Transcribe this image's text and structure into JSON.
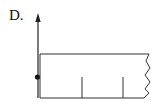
{
  "figure": {
    "option_label": "D.",
    "stroke_color": "#222222",
    "background": "#ffffff"
  },
  "diagram": {
    "elements": [
      {
        "type": "arrow",
        "direction": "up",
        "x": 38,
        "y_from": 98,
        "y_to": 15
      },
      {
        "type": "dot",
        "x": 37,
        "y": 77
      },
      {
        "type": "rectangle-partial",
        "x_left": 40,
        "y_top": 54,
        "y_bottom": 98,
        "x_right_break": 150
      },
      {
        "type": "tick",
        "x": 82,
        "y_from": 77,
        "y_to": 98
      },
      {
        "type": "tick",
        "x": 123,
        "y_from": 77,
        "y_to": 98
      },
      {
        "type": "break-line",
        "side": "right"
      }
    ]
  }
}
